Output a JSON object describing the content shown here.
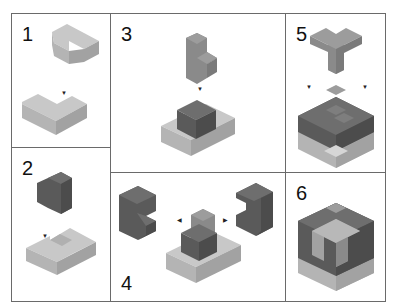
{
  "colors": {
    "light_top": "#c8c8c8",
    "light_left": "#b4b4b4",
    "light_right": "#a2a2a2",
    "mid_top": "#9c9c9c",
    "mid_left": "#8a8a8a",
    "mid_right": "#7a7a7a",
    "dark_top": "#6e6e6e",
    "dark_left": "#5a5a5a",
    "dark_right": "#4c4c4c",
    "border": "#6a6a6a"
  },
  "panels": [
    {
      "step": "1",
      "description": "T-shaped light piece placed onto L-shaped light base"
    },
    {
      "step": "2",
      "description": "Dark block placed into notch of U-shaped base"
    },
    {
      "step": "3",
      "description": "Mid-gray L piece placed on top of dark block on base"
    },
    {
      "step": "4",
      "description": "Two dark C-shaped pieces attached from left and right"
    },
    {
      "step": "5",
      "description": "Mid-gray Y piece placed on top of assembly"
    },
    {
      "step": "6",
      "description": "Completed cube"
    }
  ]
}
